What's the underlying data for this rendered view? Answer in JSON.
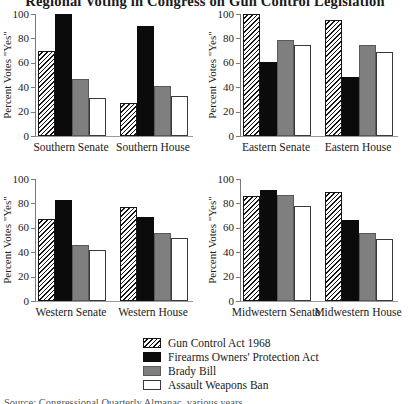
{
  "page": {
    "title": "Regional Voting in Congress on Gun Control Legislation",
    "source_note": "Source: Congressional Quarterly Almanac, various years."
  },
  "colors": {
    "background": "#ffffff",
    "bar_black": "#0b0b0b",
    "bar_gray": "#7f7f7f",
    "hatch_foreground": "#151515",
    "hatch_background": "#ffffff",
    "axis": "#7a7a7a",
    "text": "#1a1a1a"
  },
  "legend": {
    "position": "bottom-center",
    "entries": [
      {
        "label": "Gun Control Act 1968",
        "style": "hatch"
      },
      {
        "label": "Firearms Owners' Protection Act",
        "style": "black"
      },
      {
        "label": "Brady Bill",
        "style": "gray"
      },
      {
        "label": "Assault Weapons Ban",
        "style": "white"
      }
    ]
  },
  "chart_data": [
    {
      "type": "bar",
      "region": "Southern",
      "categories": [
        "Southern Senate",
        "Southern House"
      ],
      "ylabel": "Percent Votes \"Yes\"",
      "ylim": [
        0,
        100
      ],
      "yticks": [
        0,
        20,
        40,
        60,
        80,
        100
      ],
      "grid": false,
      "series": [
        {
          "name": "Gun Control Act 1968",
          "values": [
            70,
            27
          ]
        },
        {
          "name": "Firearms Owners' Protection Act",
          "values": [
            100,
            90
          ]
        },
        {
          "name": "Brady Bill",
          "values": [
            47,
            41
          ]
        },
        {
          "name": "Assault Weapons Ban",
          "values": [
            31,
            33
          ]
        }
      ]
    },
    {
      "type": "bar",
      "region": "Eastern",
      "categories": [
        "Eastern Senate",
        "Eastern House"
      ],
      "ylabel": "Percent Votes \"Yes\"",
      "ylim": [
        0,
        100
      ],
      "yticks": [
        0,
        20,
        40,
        60,
        80,
        100
      ],
      "grid": false,
      "series": [
        {
          "name": "Gun Control Act 1968",
          "values": [
            100,
            95
          ]
        },
        {
          "name": "Firearms Owners' Protection Act",
          "values": [
            61,
            48
          ]
        },
        {
          "name": "Brady Bill",
          "values": [
            79,
            75
          ]
        },
        {
          "name": "Assault Weapons Ban",
          "values": [
            75,
            69
          ]
        }
      ]
    },
    {
      "type": "bar",
      "region": "Western",
      "categories": [
        "Western Senate",
        "Western House"
      ],
      "ylabel": "Percent Votes \"Yes\"",
      "ylim": [
        0,
        100
      ],
      "yticks": [
        0,
        20,
        40,
        60,
        80,
        100
      ],
      "grid": false,
      "series": [
        {
          "name": "Gun Control Act 1968",
          "values": [
            67,
            77
          ]
        },
        {
          "name": "Firearms Owners' Protection Act",
          "values": [
            83,
            69
          ]
        },
        {
          "name": "Brady Bill",
          "values": [
            46,
            56
          ]
        },
        {
          "name": "Assault Weapons Ban",
          "values": [
            42,
            52
          ]
        }
      ]
    },
    {
      "type": "bar",
      "region": "Midwestern",
      "categories": [
        "Midwestern Senate",
        "Midwestern House"
      ],
      "ylabel": "Percent Votes \"Yes\"",
      "ylim": [
        0,
        100
      ],
      "yticks": [
        0,
        20,
        40,
        60,
        80,
        100
      ],
      "grid": false,
      "series": [
        {
          "name": "Gun Control Act 1968",
          "values": [
            86,
            89
          ]
        },
        {
          "name": "Firearms Owners' Protection Act",
          "values": [
            91,
            66
          ]
        },
        {
          "name": "Brady Bill",
          "values": [
            87,
            56
          ]
        },
        {
          "name": "Assault Weapons Ban",
          "values": [
            78,
            51
          ]
        }
      ]
    }
  ]
}
